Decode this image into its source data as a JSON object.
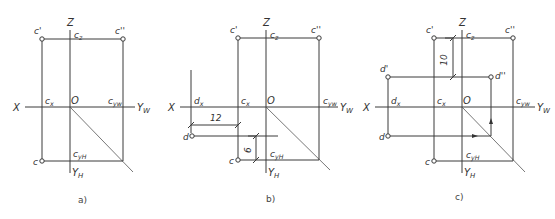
{
  "figure": {
    "panels": [
      {
        "id": "a",
        "caption": "a)",
        "caption_pos": [
          78,
          203
        ],
        "axes": {
          "origin": [
            70,
            107
          ],
          "x_axis": [
            25,
            135
          ],
          "z_axis": [
            30,
            173
          ],
          "diagonal_end": [
            133,
            172
          ],
          "labels": {
            "X": "X",
            "Z": "Z",
            "O": "O",
            "YW": "Y",
            "YW_sub": "W",
            "YH": "Y",
            "YH_sub": "H"
          }
        },
        "points": [
          {
            "name": "c'",
            "xy": [
              42,
              39
            ]
          },
          {
            "name": "c''",
            "xy": [
              123,
              39
            ]
          },
          {
            "name": "c",
            "xy": [
              42,
              161
            ]
          }
        ],
        "projection_labels": [
          {
            "text": "c",
            "sub": "z",
            "xy": [
              74,
              38
            ]
          },
          {
            "text": "c",
            "sub": "x",
            "xy": [
              45,
              104
            ]
          },
          {
            "text": "c",
            "sub": "yw",
            "xy": [
              108,
              104
            ]
          },
          {
            "text": "c",
            "sub": "yH",
            "xy": [
              73,
              157
            ]
          }
        ],
        "lines": [
          [
            42,
            39,
            123,
            39
          ],
          [
            42,
            39,
            42,
            161
          ],
          [
            123,
            39,
            123,
            161
          ],
          [
            42,
            161,
            123,
            161
          ]
        ],
        "dimensions": [],
        "arrows": []
      },
      {
        "id": "b",
        "caption": "b)",
        "caption_pos": [
          266,
          202
        ],
        "axes": {
          "origin": [
            266,
            107
          ],
          "x_axis": [
            180,
            338
          ],
          "z_axis": [
            30,
            173
          ],
          "diagonal_end": [
            330,
            170
          ],
          "labels": {
            "X": "X",
            "Z": "Z",
            "O": "O",
            "YW": "Y",
            "YW_sub": "W",
            "YH": "Y",
            "YH_sub": "H"
          }
        },
        "points": [
          {
            "name": "c'",
            "xy": [
              238,
              38
            ]
          },
          {
            "name": "c''",
            "xy": [
              319,
              38
            ]
          },
          {
            "name": "c",
            "xy": [
              238,
              160
            ]
          },
          {
            "name": "d",
            "xy": [
              192,
              136
            ]
          }
        ],
        "projection_labels": [
          {
            "text": "c",
            "sub": "z",
            "xy": [
              270,
              38
            ]
          },
          {
            "text": "c",
            "sub": "x",
            "xy": [
              241,
              104
            ]
          },
          {
            "text": "d",
            "sub": "x",
            "xy": [
              194,
              104
            ]
          },
          {
            "text": "c",
            "sub": "yw",
            "xy": [
              323,
              104
            ]
          },
          {
            "text": "c",
            "sub": "yH",
            "xy": [
              270,
              157
            ]
          }
        ],
        "lines": [
          [
            238,
            38,
            319,
            38
          ],
          [
            238,
            38,
            238,
            160
          ],
          [
            319,
            38,
            319,
            160
          ],
          [
            238,
            160,
            319,
            160
          ],
          [
            191,
            70,
            191,
            133
          ],
          [
            192,
            136,
            278,
            136
          ]
        ],
        "dimensions": [
          {
            "value": "12",
            "from": [
              191,
              125
            ],
            "to": [
              238,
              125
            ],
            "orient": "h",
            "text_pos": [
              210,
              121
            ]
          },
          {
            "value": "6",
            "from": [
              256,
              136
            ],
            "to": [
              256,
              160
            ],
            "orient": "v",
            "text_pos": [
              251,
              150
            ]
          }
        ],
        "arrows": []
      },
      {
        "id": "c",
        "caption": "c)",
        "caption_pos": [
          455,
          200
        ],
        "axes": {
          "origin": [
            462,
            107
          ],
          "x_axis": [
            375,
            535
          ],
          "z_axis": [
            30,
            173
          ],
          "diagonal_end": [
            525,
            172
          ],
          "labels": {
            "X": "X",
            "Z": "Z",
            "O": "O",
            "YW": "Y",
            "YW_sub": "W",
            "YH": "Y",
            "YH_sub": "H"
          }
        },
        "points": [
          {
            "name": "c'",
            "xy": [
              434,
              38
            ]
          },
          {
            "name": "c''",
            "xy": [
              513,
              38
            ]
          },
          {
            "name": "c",
            "xy": [
              434,
              161
            ]
          },
          {
            "name": "d'",
            "xy": [
              388,
              77
            ]
          },
          {
            "name": "d''",
            "xy": [
              491,
              77
            ]
          },
          {
            "name": "d",
            "xy": [
              388,
              136
            ]
          }
        ],
        "projection_labels": [
          {
            "text": "c",
            "sub": "z",
            "xy": [
              466,
              38
            ]
          },
          {
            "text": "c",
            "sub": "x",
            "xy": [
              437,
              104
            ]
          },
          {
            "text": "d",
            "sub": "x",
            "xy": [
              391,
              104
            ]
          },
          {
            "text": "c",
            "sub": "yw",
            "xy": [
              516,
              104
            ]
          },
          {
            "text": "c",
            "sub": "yH",
            "xy": [
              466,
              158
            ]
          }
        ],
        "lines": [
          [
            434,
            38,
            513,
            38
          ],
          [
            434,
            38,
            434,
            161
          ],
          [
            513,
            38,
            513,
            161
          ],
          [
            434,
            161,
            513,
            161
          ],
          [
            388,
            77,
            491,
            77
          ],
          [
            388,
            77,
            388,
            136
          ],
          [
            388,
            136,
            491,
            136
          ],
          [
            491,
            77,
            491,
            136
          ]
        ],
        "dimensions": [
          {
            "value": "10",
            "from": [
              453,
              38
            ],
            "to": [
              453,
              77
            ],
            "orient": "v",
            "text_pos": [
              447,
              60
            ]
          }
        ],
        "arrows": [
          {
            "at": [
              477,
              136
            ],
            "dir": "right"
          },
          {
            "at": [
              491,
              119
            ],
            "dir": "up"
          }
        ]
      }
    ]
  }
}
